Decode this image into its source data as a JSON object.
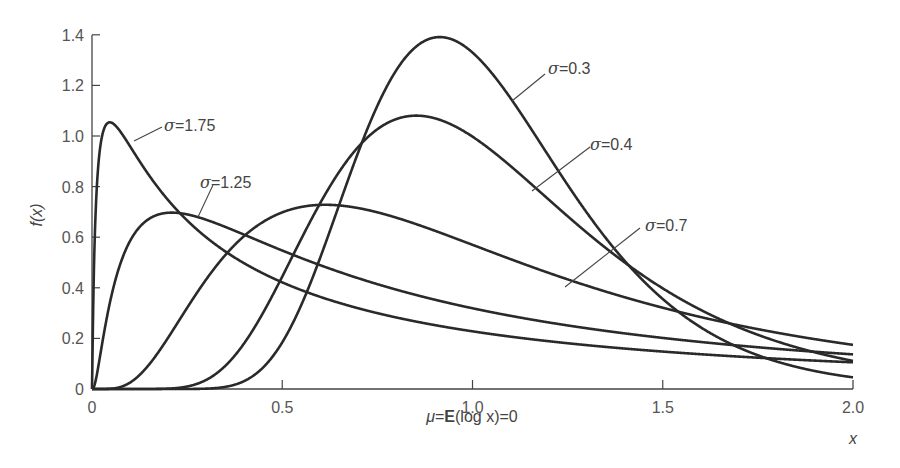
{
  "chart_data": {
    "type": "line",
    "title": "",
    "xlabel": "x",
    "ylabel": "f(x)",
    "subtitle": "μ=E(log x)=0",
    "xlim": [
      0,
      2.0
    ],
    "ylim": [
      0,
      1.4
    ],
    "x_ticks": [
      "0",
      "0.5",
      "1.0",
      "1.5",
      "2.0"
    ],
    "y_ticks": [
      "0",
      "0.2",
      "0.4",
      "0.6",
      "0.8",
      "1.0",
      "1.2",
      "1.4"
    ],
    "grid": false,
    "legend": "inline annotations",
    "series": [
      {
        "name": "σ=0.3",
        "formula": "lognormal(mu=0, sigma=0.3)",
        "peak": {
          "x": 0.91,
          "y": 1.37
        }
      },
      {
        "name": "σ=0.4",
        "formula": "lognormal(mu=0, sigma=0.4)",
        "peak": {
          "x": 0.85,
          "y": 1.05
        }
      },
      {
        "name": "σ=0.7",
        "formula": "lognormal(mu=0, sigma=0.7)",
        "peak": {
          "x": 0.61,
          "y": 0.7
        }
      },
      {
        "name": "σ=1.25",
        "formula": "lognormal(mu=0, sigma=1.25)",
        "peak": {
          "x": 0.21,
          "y": 0.69
        }
      },
      {
        "name": "σ=1.75",
        "formula": "lognormal(mu=0, sigma=1.75)",
        "peak": {
          "x": 0.047,
          "y": 1.05
        }
      }
    ]
  },
  "labels": {
    "ylabel": "f(x)",
    "xlabel": "x",
    "caption_mu": "μ",
    "caption_eq1": "=",
    "caption_E": "E",
    "caption_rest": "(log x)=0",
    "sigma": "σ",
    "ann": [
      "=0.3",
      "=0.4",
      "=0.7",
      "=1.25",
      "=1.75"
    ]
  }
}
